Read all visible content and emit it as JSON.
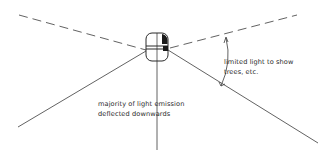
{
  "diagram": {
    "type": "light-distribution",
    "annotations": {
      "upper": {
        "lines": [
          "limited light to show",
          "trees, etc."
        ]
      },
      "lower": {
        "lines": [
          "majority of light emission",
          "deflected downwards"
        ]
      }
    },
    "colors": {
      "line": "#3a3a3a",
      "text": "#2a2a2a",
      "background": "#ffffff"
    }
  }
}
